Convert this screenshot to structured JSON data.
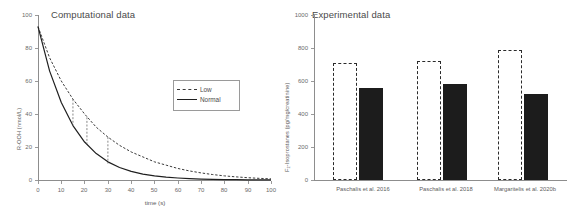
{
  "figure": {
    "panels": [
      "Computational data",
      "Experimental data"
    ]
  },
  "left_panel": {
    "title": "Computational data",
    "ylabel": "R-OOH (nmol/L)",
    "xlabel": "time (s)",
    "legend": {
      "low_label": "Low",
      "normal_label": "Normal"
    }
  },
  "right_panel": {
    "title": "Experimental data",
    "ylabel": "F₂-Isoprostanes (pg/mg/creatinine)",
    "xlabel": ""
  },
  "chart_data": [
    {
      "type": "line",
      "title": "Computational data",
      "xlabel": "time (s)",
      "ylabel": "R-OOH (nmol/L)",
      "xlim": [
        0,
        100
      ],
      "ylim": [
        0,
        100
      ],
      "xticks": [
        0,
        10,
        20,
        30,
        40,
        50,
        60,
        70,
        80,
        90,
        100
      ],
      "yticks": [
        0,
        20,
        40,
        60,
        80,
        100
      ],
      "grid": false,
      "legend_position": "center-right",
      "series": [
        {
          "name": "Low",
          "style": "dashed",
          "color": "#3a3a3a",
          "x": [
            0,
            5,
            10,
            15,
            20,
            25,
            30,
            35,
            40,
            45,
            50,
            55,
            60,
            65,
            70,
            75,
            80,
            85,
            90,
            95,
            100
          ],
          "values": [
            93,
            74,
            60,
            49,
            40,
            32,
            26,
            21,
            17,
            14,
            11,
            9,
            7,
            5.5,
            4.3,
            3.3,
            2.5,
            1.9,
            1.4,
            1.0,
            0.7
          ]
        },
        {
          "name": "Normal",
          "style": "solid",
          "color": "#1f1f1f",
          "x": [
            0,
            5,
            10,
            15,
            20,
            25,
            30,
            35,
            40,
            45,
            50,
            55,
            60,
            65,
            70,
            75,
            80,
            85,
            90,
            95,
            100
          ],
          "values": [
            93,
            66,
            47,
            33,
            23,
            16,
            11,
            7.6,
            5.2,
            3.6,
            2.5,
            1.7,
            1.2,
            0.8,
            0.55,
            0.38,
            0.26,
            0.18,
            0.12,
            0.08,
            0.05
          ]
        }
      ],
      "annotations": [
        {
          "type": "drop-line",
          "x": 15,
          "y_from": 49,
          "y_to": 33,
          "style": "dashed"
        },
        {
          "type": "drop-line",
          "x": 21,
          "y_from": 38,
          "y_to": 22,
          "style": "dashed"
        },
        {
          "type": "drop-line",
          "x": 30,
          "y_from": 26,
          "y_to": 10,
          "style": "dashed"
        }
      ]
    },
    {
      "type": "bar",
      "title": "Experimental data",
      "xlabel": "",
      "ylabel": "F₂-Isoprostanes (pg/mg/creatinine)",
      "ylim": [
        0,
        1000
      ],
      "yticks": [
        0,
        200,
        400,
        600,
        800,
        1000
      ],
      "grid": false,
      "categories": [
        "Paschalis et al. 2016",
        "Paschalis et al. 2018",
        "Margaritelis et al. 2020b"
      ],
      "series": [
        {
          "name": "Low",
          "style": "dashed-outline",
          "color": "#2a2a2a",
          "values": [
            710,
            720,
            785
          ]
        },
        {
          "name": "Normal",
          "style": "solid-fill",
          "color": "#1c1c1c",
          "values": [
            560,
            580,
            520
          ]
        }
      ]
    }
  ]
}
